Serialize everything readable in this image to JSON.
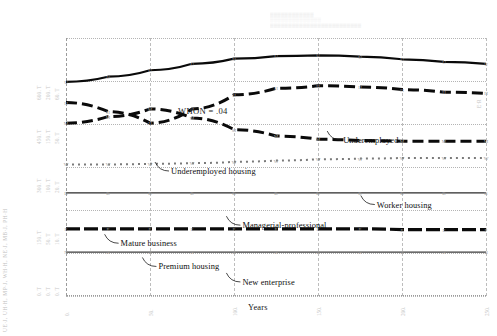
{
  "figure": {
    "annotation": "WHON = .04",
    "xlabel": "Years",
    "y_axis_caption": "UE∙J, UH∙H, MP∙J, WH∙H, NE∙J, MB∙J, PH∙H",
    "right_edge_mark": "E·R",
    "top_band_line1": "▒▒▒▒▒▒▒▒▒▒▒▒",
    "top_band_line2": "░░░░░░░░░░░░░░",
    "top_band_line3": "▒▒▒▒▒▒▒▒▒▒▒▒▒▒▒▒▒▒▒▒▒▒▒▒▒"
  },
  "chart_data": {
    "type": "line",
    "title": "",
    "subtitle": "",
    "xlabel": "Years",
    "ylabel": "",
    "grid": true,
    "legend_position": "inline-annotations",
    "xlim": [
      0,
      250
    ],
    "x_ticks": [
      0,
      50,
      100,
      150,
      200,
      250
    ],
    "x_tick_labels": [
      "0.",
      "50.",
      "100.",
      "150.",
      "200.",
      "250."
    ],
    "y_scale_groups": [
      {
        "labels": [
          "600. T",
          "200. T",
          "60. T"
        ],
        "position_pct": 14
      },
      {
        "labels": [
          "450. T",
          "150. T",
          "50. T"
        ],
        "position_pct": 31
      },
      {
        "labels": [
          "300. T",
          "100. T",
          "20. T"
        ],
        "position_pct": 50
      },
      {
        "labels": [
          "150. T",
          "50. T",
          "10. T"
        ],
        "position_pct": 70
      },
      {
        "labels": [
          "0. T",
          "0. T",
          "0. T"
        ],
        "position_pct": 90
      }
    ],
    "x": [
      0,
      25,
      50,
      75,
      100,
      125,
      150,
      175,
      200,
      225,
      250
    ],
    "series": [
      {
        "name": "Underemployed",
        "style": "solid",
        "symbol": "U",
        "values": [
          332,
          340,
          350,
          360,
          368,
          372,
          373,
          371,
          367,
          363,
          360
        ]
      },
      {
        "name": "Underemployed housing",
        "style": "dashed",
        "symbol": "H",
        "values": [
          300,
          286,
          268,
          290,
          312,
          322,
          326,
          324,
          320,
          316,
          314
        ]
      },
      {
        "name": "Managerial-professional",
        "style": "dashed",
        "symbol": "M",
        "values": [
          268,
          278,
          290,
          276,
          258,
          248,
          243,
          241,
          240,
          240,
          240
        ]
      },
      {
        "name": "Worker housing",
        "style": "square-dotted",
        "symbol": "W",
        "values": [
          204,
          204,
          205,
          206,
          208,
          210,
          212,
          213,
          214,
          214,
          214
        ]
      },
      {
        "name": "Mature business",
        "style": "solid-thin",
        "symbol": "B",
        "values": [
          160,
          160,
          160,
          160,
          160,
          160,
          160,
          160,
          160,
          160,
          160
        ]
      },
      {
        "name": "Premium housing",
        "style": "heavy-dashed",
        "symbol": "P",
        "values": [
          104,
          104,
          104,
          104,
          104,
          104,
          104,
          104,
          103,
          103,
          103
        ]
      },
      {
        "name": "New enterprise",
        "style": "thin",
        "symbol": "N",
        "values": [
          68,
          68,
          68,
          68,
          68,
          68,
          68,
          68,
          68,
          68,
          68
        ]
      }
    ],
    "annotations": [
      {
        "text": "WHON = .04",
        "x_pct": 11,
        "y_pct": 12
      },
      {
        "text": "Underemployed",
        "x_pct": 66,
        "y_pct": 38
      },
      {
        "text": "Underemployed housing",
        "x_pct": 25,
        "y_pct": 50
      },
      {
        "text": "Worker housing",
        "x_pct": 74,
        "y_pct": 63
      },
      {
        "text": "Managerial-professional",
        "x_pct": 42,
        "y_pct": 71
      },
      {
        "text": "Mature business",
        "x_pct": 13,
        "y_pct": 78
      },
      {
        "text": "Premium housing",
        "x_pct": 22,
        "y_pct": 87
      },
      {
        "text": "New enterprise",
        "x_pct": 42,
        "y_pct": 93
      }
    ]
  }
}
